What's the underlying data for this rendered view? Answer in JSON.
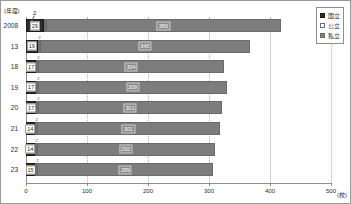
{
  "axes": {
    "y_unit": "(年度)",
    "x_unit": "(校)",
    "x_ticks": [
      "0",
      "100",
      "200",
      "300",
      "400",
      "500"
    ]
  },
  "legend": {
    "items": [
      {
        "label": "国立",
        "color": "#2b2b2b"
      },
      {
        "label": "公立",
        "color": "#ffffff"
      },
      {
        "label": "私立",
        "color": "#7d7d7d"
      }
    ]
  },
  "annotation": {
    "koritsu_callout": "2"
  },
  "chart_data": {
    "type": "bar",
    "orientation": "horizontal",
    "stacked": true,
    "title": "",
    "xlabel": "(校)",
    "ylabel": "(年度)",
    "xlim": [
      0,
      500
    ],
    "grid": true,
    "legend_position": "top-right",
    "categories": [
      "2008",
      "13",
      "18",
      "19",
      "20",
      "21",
      "22",
      "23"
    ],
    "series": [
      {
        "name": "国立",
        "values": [
          29,
          19,
          17,
          17,
          17,
          14,
          14,
          15
        ]
      },
      {
        "name": "公立",
        "values": [
          2,
          2,
          2,
          2,
          2,
          2,
          2,
          2
        ]
      },
      {
        "name": "私立",
        "values": [
          386,
          345,
          304,
          309,
          301,
          301,
          292,
          289
        ]
      }
    ],
    "totals": [
      417,
      366,
      323,
      328,
      320,
      317,
      308,
      306
    ]
  }
}
